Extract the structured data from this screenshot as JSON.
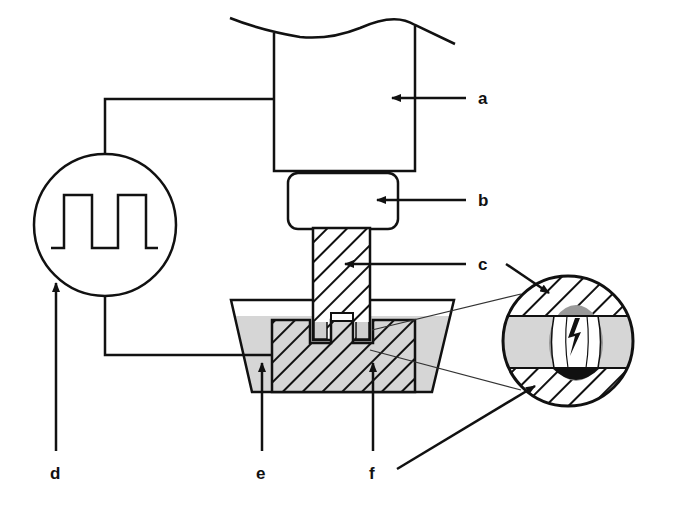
{
  "diagram": {
    "type": "schematic",
    "labels": {
      "a": "a",
      "b": "b",
      "c": "c",
      "d": "d",
      "e": "e",
      "f": "f"
    },
    "components": [
      {
        "id": "a",
        "shape": "rectangle with wavy top (machine head)"
      },
      {
        "id": "b",
        "shape": "rounded rectangle (holder)"
      },
      {
        "id": "c",
        "shape": "hatched vertical bar (tool electrode)"
      },
      {
        "id": "d",
        "shape": "circle with square wave (pulse generator)"
      },
      {
        "id": "e",
        "shape": "trapezoidal tank with grey fluid (dielectric)"
      },
      {
        "id": "f",
        "shape": "hatched block (workpiece)"
      }
    ],
    "detail_view": {
      "shape": "circle",
      "content": "spark gap between electrode and workpiece with lightning bolt"
    },
    "colors": {
      "line": "#111111",
      "fluid": "#d6d6d6",
      "background": "#ffffff",
      "crater": "#9a9a9a"
    }
  }
}
